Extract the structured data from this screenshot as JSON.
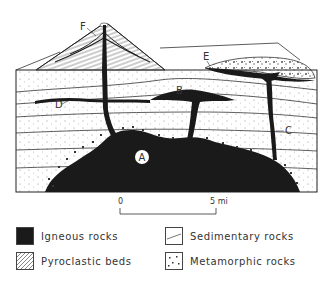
{
  "diagram": {
    "type": "geologic cross-section",
    "labels": {
      "A": "A",
      "B": "B",
      "C": "C",
      "D": "D",
      "E": "E",
      "F": "F"
    },
    "scale_bar": {
      "start": "0",
      "end": "5 mi"
    },
    "legend": [
      {
        "key": "igneous",
        "label": "Igneous rocks",
        "pattern": "solid-black"
      },
      {
        "key": "sedimentary",
        "label": "Sedimentary rocks",
        "pattern": "lines"
      },
      {
        "key": "pyroclastic",
        "label": "Pyroclastic beds",
        "pattern": "diagonal-hatch"
      },
      {
        "key": "metamorphic",
        "label": "Metamorphic rocks",
        "pattern": "scattered-dots"
      }
    ],
    "colors": {
      "ink": "#1a1a1a",
      "background": "#ffffff"
    }
  }
}
